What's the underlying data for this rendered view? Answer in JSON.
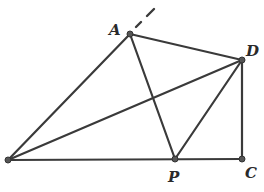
{
  "diagram": {
    "type": "geometry",
    "points": {
      "A": {
        "label": "A",
        "x": 130,
        "y": 34,
        "label_x": 109,
        "label_y": 35
      },
      "D": {
        "label": "D",
        "x": 242,
        "y": 60,
        "label_x": 246,
        "label_y": 56
      },
      "B": {
        "label": "",
        "x": 8,
        "y": 160
      },
      "P": {
        "label": "P",
        "x": 175,
        "y": 159,
        "label_x": 168,
        "label_y": 182
      },
      "C": {
        "label": "C",
        "x": 242,
        "y": 159,
        "label_x": 245,
        "label_y": 178
      }
    },
    "segments": [
      [
        "B",
        "A"
      ],
      [
        "A",
        "D"
      ],
      [
        "A",
        "P"
      ],
      [
        "B",
        "D"
      ],
      [
        "D",
        "P"
      ],
      [
        "D",
        "C"
      ],
      [
        "B",
        "C"
      ]
    ],
    "dashed_extension": {
      "from": "A",
      "x1": 136,
      "y1": 27,
      "x2": 154,
      "y2": 9
    }
  }
}
